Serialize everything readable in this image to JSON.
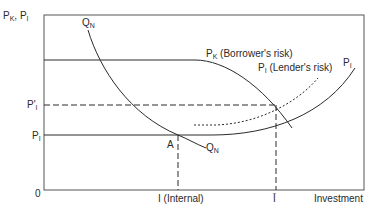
{
  "diagram": {
    "type": "economics-diagram",
    "y_axis_label": {
      "main": "P",
      "sub1": "K",
      "sep": ", P",
      "sub2": "I"
    },
    "x_axis_label": "Investment",
    "origin_label": "0",
    "y_ticks": [
      {
        "main": "P'",
        "sub": "I",
        "name": "p-prime-l"
      },
      {
        "main": "P",
        "sub": "I",
        "name": "p-l"
      }
    ],
    "x_ticks": [
      {
        "label": "I (Internal)",
        "name": "i-internal"
      },
      {
        "label": "Ī",
        "name": "i-bar"
      }
    ],
    "curves": [
      {
        "name": "qn-curve",
        "label_main": "Q",
        "label_sub": "N",
        "style": "solid"
      },
      {
        "name": "pk-curve",
        "label_main": "P",
        "label_sub": "K",
        "label_rest": " (Borrower's risk)",
        "style": "solid"
      },
      {
        "name": "pl-curve",
        "label_main": "P",
        "label_sub": "I",
        "style": "solid"
      },
      {
        "name": "pl-lender-curve",
        "label_main": "P",
        "label_sub": "I",
        "label_rest": " (Lender's risk)",
        "style": "dotted"
      }
    ],
    "points": [
      {
        "name": "point-a",
        "label": "A"
      }
    ],
    "colors": {
      "line": "#2a2a2a",
      "frame": "#555555",
      "background": "#ffffff"
    }
  }
}
